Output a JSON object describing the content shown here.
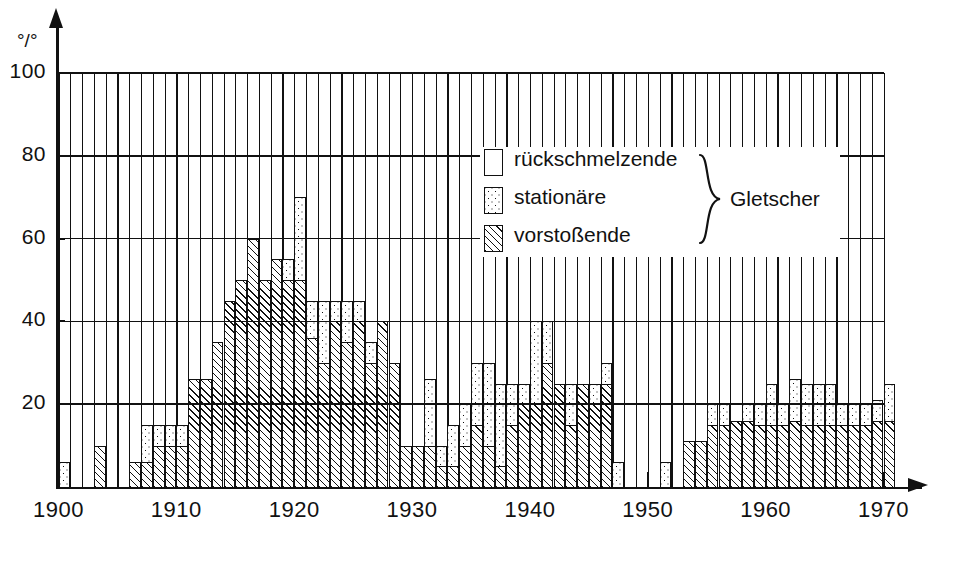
{
  "axes": {
    "y_unit_label": "°/°",
    "y_ticks": [
      0,
      20,
      40,
      60,
      80,
      100
    ],
    "y_tick_labels": [
      "",
      "20",
      "40",
      "60",
      "80",
      "100"
    ],
    "x_ticks": [
      1900,
      1910,
      1920,
      1930,
      1940,
      1950,
      1960,
      1970
    ],
    "x_tick_labels": [
      "1900",
      "1910",
      "1920",
      "1930",
      "1940",
      "1950",
      "1960",
      "1970"
    ]
  },
  "legend": {
    "items": [
      {
        "key": "rueck",
        "label": "rückschmelzende",
        "pattern": "white"
      },
      {
        "key": "stat",
        "label": "stationäre",
        "pattern": "dotted"
      },
      {
        "key": "vor",
        "label": "vorstoßende",
        "pattern": "hatched"
      }
    ],
    "brace_label": "Gletscher"
  },
  "chart_data": {
    "type": "bar",
    "title": "",
    "subtitle": "",
    "xlabel": "",
    "ylabel": "°/°",
    "ylim": [
      0,
      100
    ],
    "xlim": [
      1900,
      1970
    ],
    "grid": "horizontal-and-vertical",
    "legend_position": "inside-top-right",
    "stacking": "stacked-from-zero",
    "series_order": [
      "vorstoßende",
      "stationäre",
      "rückschmelzende"
    ],
    "series_colors": {
      "vorstoßende": "#111111",
      "stationäre": "#111111",
      "rückschmelzende": "#ffffff"
    },
    "note": "Values are percentages of observed glaciers. 'vorstoßende' is the lower hatched segment, 'stationäre' the dotted segment stacked above it; the remainder up to 100% is 'rückschmelzende' (white, not drawn).",
    "categories": [
      1900,
      1901,
      1902,
      1903,
      1904,
      1905,
      1906,
      1907,
      1908,
      1909,
      1910,
      1911,
      1912,
      1913,
      1914,
      1915,
      1916,
      1917,
      1918,
      1919,
      1920,
      1921,
      1922,
      1923,
      1924,
      1925,
      1926,
      1927,
      1928,
      1929,
      1930,
      1931,
      1932,
      1933,
      1934,
      1935,
      1936,
      1937,
      1938,
      1939,
      1940,
      1941,
      1942,
      1943,
      1944,
      1945,
      1946,
      1947,
      1948,
      1949,
      1950,
      1951,
      1952,
      1953,
      1954,
      1955,
      1956,
      1957,
      1958,
      1959,
      1960,
      1961,
      1962,
      1963,
      1964,
      1965,
      1966,
      1967,
      1968,
      1969,
      1970
    ],
    "series": [
      {
        "name": "vorstoßende",
        "values": [
          0,
          0,
          0,
          10,
          0,
          0,
          6,
          6,
          10,
          10,
          10,
          26,
          26,
          35,
          45,
          50,
          60,
          50,
          55,
          50,
          50,
          36,
          30,
          40,
          35,
          40,
          30,
          40,
          30,
          10,
          10,
          10,
          5,
          5,
          10,
          15,
          10,
          5,
          15,
          20,
          20,
          30,
          25,
          15,
          25,
          20,
          25,
          0,
          0,
          0,
          0,
          0,
          0,
          11,
          11,
          15,
          15,
          16,
          16,
          15,
          15,
          15,
          16,
          15,
          15,
          15,
          15,
          15,
          15,
          16,
          16
        ]
      },
      {
        "name": "stationäre",
        "values": [
          6,
          0,
          0,
          0,
          0,
          0,
          0,
          9,
          5,
          5,
          5,
          0,
          0,
          0,
          0,
          0,
          0,
          0,
          0,
          5,
          20,
          9,
          15,
          5,
          10,
          5,
          5,
          0,
          0,
          0,
          0,
          16,
          5,
          10,
          10,
          15,
          20,
          20,
          10,
          5,
          20,
          10,
          0,
          10,
          0,
          5,
          5,
          6,
          0,
          0,
          0,
          6,
          0,
          0,
          0,
          5,
          5,
          0,
          4,
          5,
          10,
          5,
          10,
          10,
          10,
          10,
          5,
          5,
          5,
          5,
          9
        ]
      }
    ],
    "totals": [
      6,
      0,
      0,
      10,
      0,
      0,
      6,
      15,
      15,
      15,
      15,
      26,
      26,
      35,
      45,
      50,
      60,
      50,
      55,
      55,
      70,
      45,
      45,
      45,
      45,
      45,
      35,
      40,
      30,
      10,
      10,
      26,
      10,
      15,
      20,
      30,
      30,
      25,
      25,
      25,
      40,
      40,
      25,
      25,
      25,
      25,
      30,
      6,
      0,
      0,
      0,
      6,
      0,
      11,
      11,
      20,
      20,
      16,
      20,
      20,
      25,
      20,
      26,
      25,
      25,
      25,
      20,
      20,
      20,
      21,
      25
    ],
    "data_gaps": [
      1948,
      1949,
      1950,
      1952
    ]
  }
}
